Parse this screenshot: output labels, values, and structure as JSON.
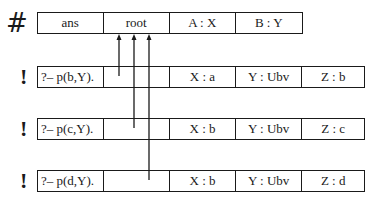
{
  "diagram": {
    "top_frame": {
      "marker": "#",
      "cells": [
        "ans",
        "root",
        "A : X",
        "B : Y"
      ]
    },
    "choice_frames": [
      {
        "marker": "!",
        "goal": "?– p(b,Y).",
        "slot": "",
        "bindings": [
          "X : a",
          "Y : Ubv",
          "Z : b"
        ]
      },
      {
        "marker": "!",
        "goal": "?– p(c,Y).",
        "slot": "",
        "bindings": [
          "X : b",
          "Y : Ubv",
          "Z : c"
        ]
      },
      {
        "marker": "!",
        "goal": "?– p(d,Y).",
        "slot": "",
        "bindings": [
          "X : b",
          "Y : Ubv",
          "Z : d"
        ]
      }
    ],
    "links": [
      {
        "from": "choice_frames.0.slot",
        "to": "top_frame.root"
      },
      {
        "from": "choice_frames.1.slot",
        "to": "top_frame.root"
      },
      {
        "from": "choice_frames.2.slot",
        "to": "top_frame.root"
      }
    ],
    "colors": {
      "ink": "#1a1a1a",
      "background": "#ffffff"
    }
  }
}
